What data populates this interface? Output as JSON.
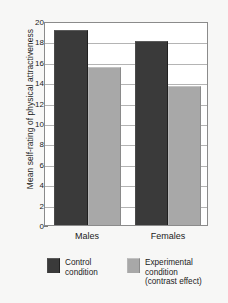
{
  "chart_data": {
    "type": "bar",
    "title": "",
    "xlabel": "",
    "ylabel": "Mean self-rating of physical attractiveness",
    "categories": [
      "Males",
      "Females"
    ],
    "series": [
      {
        "name": "Control condition",
        "values": [
          19.1,
          18.0
        ],
        "color": "#3a3a3a"
      },
      {
        "name": "Experimental condition (contrast effect)",
        "values": [
          15.5,
          13.6
        ],
        "color": "#a8a8a8"
      }
    ],
    "ylim": [
      0,
      20
    ],
    "ytick_step": 2,
    "yticks": [
      "0",
      "2",
      "4",
      "6",
      "8",
      "10",
      "12",
      "14",
      "16",
      "18",
      "20"
    ],
    "grid": true,
    "legend_position": "bottom"
  },
  "legend": {
    "entries": [
      {
        "line1": "Control",
        "line2": "condition",
        "line3": ""
      },
      {
        "line1": "Experimental",
        "line2": "condition",
        "line3": "(contrast effect)"
      }
    ]
  }
}
